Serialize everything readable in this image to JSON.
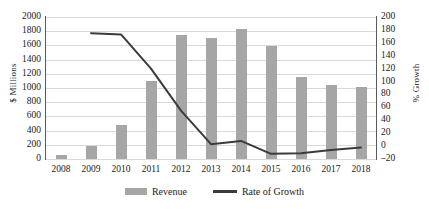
{
  "chart_data": {
    "type": "bar",
    "title": "",
    "categories": [
      "2008",
      "2009",
      "2010",
      "2011",
      "2012",
      "2013",
      "2014",
      "2015",
      "2016",
      "2017",
      "2018"
    ],
    "xlabel": "",
    "ylabel": "$ Millions",
    "y2label": "% Growth",
    "ylim": [
      0,
      2000
    ],
    "y2lim": [
      -20,
      200
    ],
    "yticks": [
      0,
      200,
      400,
      600,
      800,
      1000,
      1200,
      1400,
      1600,
      1800,
      2000
    ],
    "y2ticks": [
      -20,
      0,
      20,
      40,
      60,
      80,
      100,
      120,
      140,
      160,
      180,
      200
    ],
    "grid": true,
    "legend_position": "bottom",
    "series": [
      {
        "name": "Revenue",
        "render": "bar",
        "axis": "left",
        "color": "#a6a6a6",
        "values": [
          60,
          190,
          480,
          1100,
          1740,
          1710,
          1830,
          1590,
          1150,
          1040,
          1010
        ]
      },
      {
        "name": "Rate of Growth",
        "render": "line",
        "axis": "right",
        "color": "#3b3b3b",
        "values": [
          null,
          175,
          173,
          120,
          55,
          3,
          8,
          -12,
          -11,
          -6,
          -2
        ]
      }
    ]
  },
  "legend": {
    "items": [
      {
        "label": "Revenue",
        "marker": "bar-swatch"
      },
      {
        "label": "Rate of Growth",
        "marker": "line-swatch"
      }
    ]
  },
  "axes": {
    "left_title": "$ Millions",
    "right_title": "% Growth"
  }
}
